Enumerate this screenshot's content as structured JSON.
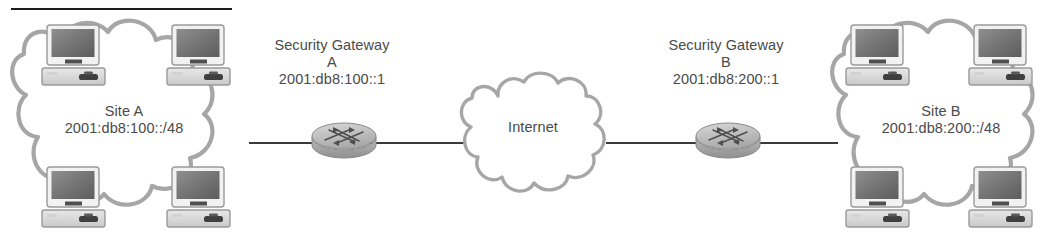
{
  "figure": {
    "type": "network-topology",
    "top_rule_visible": true
  },
  "sites": [
    {
      "id": "site-a",
      "name": "Site A",
      "prefix": "2001:db8:100::/48",
      "host_count": 4,
      "host_icon": "desktop-computer-icon",
      "cloud_icon": "network-cloud-icon"
    },
    {
      "id": "site-b",
      "name": "Site B",
      "prefix": "2001:db8:200::/48",
      "host_count": 4,
      "host_icon": "desktop-computer-icon",
      "cloud_icon": "network-cloud-icon"
    }
  ],
  "gateways": [
    {
      "id": "gateway-a",
      "title": "Security Gateway",
      "designator": "A",
      "address": "2001:db8:100::1",
      "icon": "router-icon"
    },
    {
      "id": "gateway-b",
      "title": "Security Gateway",
      "designator": "B",
      "address": "2001:db8:200::1",
      "icon": "router-icon"
    }
  ],
  "internet": {
    "label": "Internet",
    "icon": "internet-cloud-icon"
  },
  "links": [
    {
      "id": "link-site-a-gateway-a",
      "from": "site-a",
      "to": "gateway-a"
    },
    {
      "id": "link-gateway-a-internet",
      "from": "gateway-a",
      "to": "internet"
    },
    {
      "id": "link-internet-gateway-b",
      "from": "internet",
      "to": "gateway-b"
    },
    {
      "id": "link-gateway-b-site-b",
      "from": "gateway-b",
      "to": "site-b"
    }
  ],
  "colors": {
    "line": "#3a3a3a",
    "cloud_stroke": "#a6a6a6",
    "text": "#4a4a4a",
    "rule": "#1d1d1d",
    "router_body": "#b8b8b8",
    "screen_dark": "#6e6e6e"
  }
}
